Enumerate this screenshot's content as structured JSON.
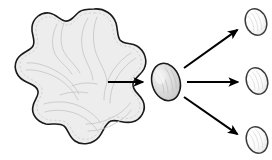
{
  "figure": {
    "background_color": "#ffffff",
    "width": 272,
    "height": 160
  },
  "palette": {
    "outline": "#1a1a1a",
    "amoeba_fill": "#ededed",
    "amoeba_texture": "#c9c9c9",
    "cyst_fill": "#d8d8d8",
    "cyst_highlight": "#f0f0f0",
    "daughter_fill": "#fcfcfc",
    "daughter_shade": "#e4e4e4",
    "arrow_color": "#000000"
  },
  "stages": [
    {
      "id": "trophozoite",
      "name": "amoeba",
      "label": "",
      "shape": "lobed-blob",
      "fill": "#ededed",
      "outline": "#1a1a1a",
      "center": [
        85,
        78
      ],
      "bbox": [
        14,
        8,
        155,
        148
      ],
      "texture_lines": 12
    },
    {
      "id": "cyst",
      "name": "cyst",
      "label": "",
      "shape": "ellipse",
      "fill": "#d8d8d8",
      "outline": "#1a1a1a",
      "center": [
        166,
        82
      ],
      "radii": [
        14,
        19
      ],
      "rotation_deg": -16
    },
    {
      "id": "daughter-top",
      "name": "daughter-cell-top",
      "label": "",
      "shape": "ellipse",
      "fill": "#fcfcfc",
      "outline": "#3a3a3a",
      "center": [
        256,
        22
      ],
      "radii": [
        10.5,
        13.5
      ],
      "rotation_deg": -18
    },
    {
      "id": "daughter-middle",
      "name": "daughter-cell-middle",
      "label": "",
      "shape": "ellipse",
      "fill": "#fcfcfc",
      "outline": "#3a3a3a",
      "center": [
        257,
        81
      ],
      "radii": [
        10.5,
        13.5
      ],
      "rotation_deg": -18
    },
    {
      "id": "daughter-bottom",
      "name": "daughter-cell-bottom",
      "label": "",
      "shape": "ellipse",
      "fill": "#fcfcfc",
      "outline": "#3a3a3a",
      "center": [
        257,
        140
      ],
      "radii": [
        10.5,
        13.5
      ],
      "rotation_deg": -18
    }
  ],
  "arrows": [
    {
      "id": "arrow-amoeba-to-cyst",
      "name": "arrow-amoeba-to-cyst",
      "label": "",
      "from": "trophozoite",
      "to": "cyst",
      "start": [
        108,
        82
      ],
      "end": [
        146,
        82
      ],
      "direction": "right",
      "color": "#000000"
    },
    {
      "id": "arrow-cyst-to-top",
      "name": "arrow-cyst-to-daughter-top",
      "label": "",
      "from": "cyst",
      "to": "daughter-top",
      "start": [
        184,
        68
      ],
      "end": [
        240,
        28
      ],
      "direction": "upper-right",
      "color": "#000000"
    },
    {
      "id": "arrow-cyst-to-middle",
      "name": "arrow-cyst-to-daughter-middle",
      "label": "",
      "from": "cyst",
      "to": "daughter-middle",
      "start": [
        187,
        82
      ],
      "end": [
        241,
        82
      ],
      "direction": "right",
      "color": "#000000"
    },
    {
      "id": "arrow-cyst-to-bottom",
      "name": "arrow-cyst-to-daughter-bottom",
      "label": "",
      "from": "cyst",
      "to": "daughter-bottom",
      "start": [
        184,
        97
      ],
      "end": [
        240,
        136
      ],
      "direction": "lower-right",
      "color": "#000000"
    }
  ]
}
